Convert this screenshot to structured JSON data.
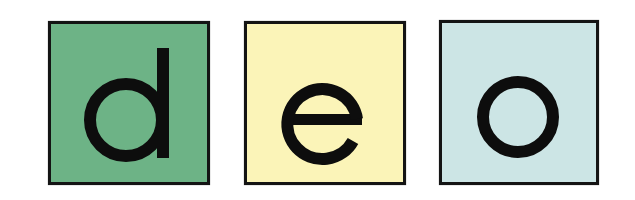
{
  "tiles": [
    {
      "letter": "d",
      "color": "#6db386",
      "glyph": "letter-d-icon"
    },
    {
      "letter": "e",
      "color": "#fbf4b8",
      "glyph": "letter-e-icon"
    },
    {
      "letter": "o",
      "color": "#cce5e5",
      "glyph": "letter-o-icon"
    }
  ],
  "colors": {
    "border": "#141414",
    "glyph": "#0d0d0d",
    "background": "#ffffff"
  }
}
